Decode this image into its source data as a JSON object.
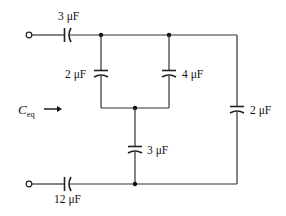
{
  "diagram": {
    "type": "capacitor-circuit",
    "equivalent_label": {
      "symbol": "C",
      "subscript": "eq"
    },
    "capacitors": [
      {
        "id": "c_top_series",
        "label": "3 μF",
        "value_uF": 3,
        "orientation": "horizontal",
        "position": "top-left series"
      },
      {
        "id": "c_left_parallel",
        "label": "2 μF",
        "value_uF": 2,
        "orientation": "vertical",
        "position": "left parallel branch"
      },
      {
        "id": "c_mid_parallel",
        "label": "4 μF",
        "value_uF": 4,
        "orientation": "vertical",
        "position": "middle parallel branch"
      },
      {
        "id": "c_center_vertical",
        "label": "3 μF",
        "value_uF": 3,
        "orientation": "vertical",
        "position": "center series to bottom"
      },
      {
        "id": "c_right_vertical",
        "label": "2 μF",
        "value_uF": 2,
        "orientation": "vertical",
        "position": "right outer branch"
      },
      {
        "id": "c_bottom_series",
        "label": "12 μF",
        "value_uF": 12,
        "orientation": "horizontal",
        "position": "bottom-left series"
      }
    ],
    "terminals": [
      {
        "id": "terminal_top",
        "position": "top-left"
      },
      {
        "id": "terminal_bottom",
        "position": "bottom-left"
      }
    ],
    "arrow": {
      "direction": "right",
      "meaning": "looking into terminals"
    }
  }
}
